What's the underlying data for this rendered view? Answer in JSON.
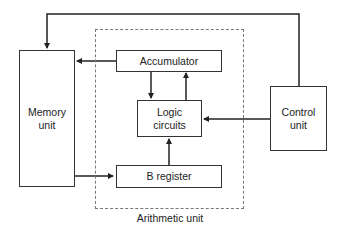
{
  "diagram": {
    "title": "",
    "blocks": {
      "memory": {
        "label": "Memory\nunit"
      },
      "accumulator": {
        "label": "Accumulator"
      },
      "logic": {
        "label": "Logic\ncircuits"
      },
      "b_register": {
        "label": "B register"
      },
      "control": {
        "label": "Control\nunit"
      }
    },
    "groups": {
      "arithmetic": {
        "label": "Arithmetic unit"
      }
    },
    "connections": [
      {
        "from": "control",
        "to": "memory",
        "route": "over top"
      },
      {
        "from": "accumulator",
        "to": "memory"
      },
      {
        "from": "accumulator",
        "to": "logic"
      },
      {
        "from": "logic",
        "to": "accumulator"
      },
      {
        "from": "control",
        "to": "logic"
      },
      {
        "from": "memory",
        "to": "b_register"
      },
      {
        "from": "b_register",
        "to": "logic"
      }
    ]
  }
}
